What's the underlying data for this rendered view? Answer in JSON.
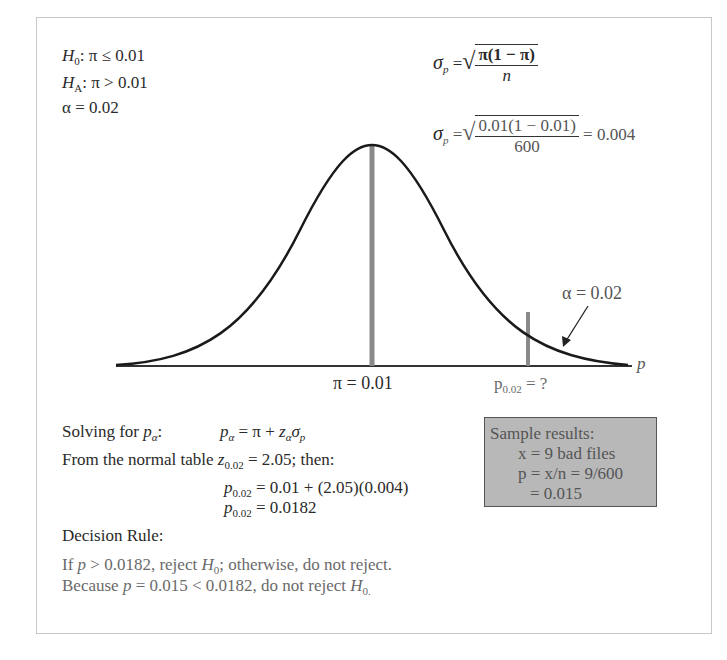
{
  "hypotheses": {
    "h0": {
      "symbol": "H",
      "sub": "0",
      "text": ": π ≤ 0.01"
    },
    "ha": {
      "symbol": "H",
      "sub": "A",
      "text": ": π > 0.01"
    },
    "alpha": "α = 0.02"
  },
  "formulas": {
    "sigma_general": {
      "lhs": "σ",
      "lhs_sub": "p",
      "eq": "=",
      "num": "π(1 − π)",
      "den": "n"
    },
    "sigma_numeric": {
      "lhs": "σ",
      "lhs_sub": "p",
      "eq": "=",
      "num": "0.01(1 − 0.01)",
      "den": "600",
      "result": "= 0.004"
    }
  },
  "curve": {
    "axis_label": "p",
    "mean_label": "π = 0.01",
    "critical_label_main": "p",
    "critical_label_sub": "0.02",
    "critical_label_tail": " = ?",
    "alpha_annotation": "α = 0.02",
    "colors": {
      "curve": "#1a1a1a",
      "markers": "#8a8a8a",
      "axis": "#333333"
    }
  },
  "solution": {
    "solving_label": "Solving for ",
    "solving_var": "p",
    "solving_var_sub": "α",
    "solving_colon": ":",
    "solving_formula": {
      "lhs": "p",
      "lhs_sub": "α",
      "rhs1": " = π + ",
      "z": "z",
      "z_sub": "α",
      "sigma": "σ",
      "sigma_sub": "p"
    },
    "normal_table_prefix": "From the normal table ",
    "normal_table_z": "z",
    "normal_table_z_sub": "0.02",
    "normal_table_suffix": " = 2.05; then:",
    "step1": {
      "lhs": "p",
      "lhs_sub": "0.02",
      "rhs": " = 0.01 + (2.05)(0.004)"
    },
    "step2": {
      "lhs": "p",
      "lhs_sub": "0.02",
      "rhs": " = 0.0182"
    }
  },
  "sample_results": {
    "title": "Sample results:",
    "line1": "x = 9 bad files",
    "line2": "p = x/n = 9/600",
    "line3": "= 0.015",
    "bg_color": "#b8b8b8"
  },
  "decision": {
    "heading": "Decision Rule:",
    "rule_part1": "If ",
    "rule_p": "p",
    "rule_part2": " > 0.0182, reject ",
    "rule_H": "H",
    "rule_H_sub": "0",
    "rule_part3": "; otherwise, do not reject.",
    "conclusion_part1": "Because ",
    "conclusion_p": "p",
    "conclusion_part2": " = 0.015 < 0.0182, do not reject ",
    "conclusion_H": "H",
    "conclusion_H_sub": "0."
  }
}
